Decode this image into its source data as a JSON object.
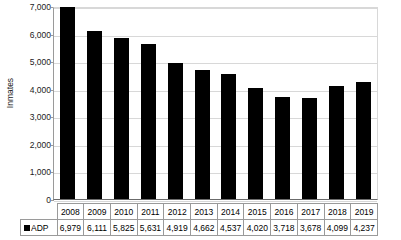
{
  "chart_data": {
    "type": "bar",
    "title": "",
    "xlabel": "",
    "ylabel": "Inmates",
    "categories": [
      "2008",
      "2009",
      "2010",
      "2011",
      "2012",
      "2013",
      "2014",
      "2015",
      "2016",
      "2017",
      "2018",
      "2019"
    ],
    "series": [
      {
        "name": "ADP",
        "values": [
          6979,
          6111,
          5825,
          5631,
          4919,
          4662,
          4537,
          4020,
          3718,
          3678,
          4099,
          4237
        ],
        "labels": [
          "6,979",
          "6,111",
          "5,825",
          "5,631",
          "4,919",
          "4,662",
          "4,537",
          "4,020",
          "3,718",
          "3,678",
          "4,099",
          "4,237"
        ],
        "color": "#000000"
      }
    ],
    "ylim": [
      0,
      7000
    ],
    "yticks": [
      7000,
      6000,
      5000,
      4000,
      3000,
      2000,
      1000,
      0
    ],
    "ytick_labels": [
      "7,000",
      "6,000",
      "5,000",
      "4,000",
      "3,000",
      "2,000",
      "1,000",
      "0"
    ],
    "grid": true,
    "legend_position": "table-row-left",
    "legend_marker": "black-square"
  },
  "table": {
    "legend_label": "ADP"
  }
}
